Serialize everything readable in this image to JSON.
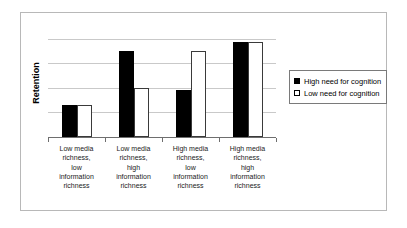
{
  "chart_data": {
    "type": "bar",
    "title": "",
    "xlabel": "",
    "ylabel": "Retention",
    "ylim": [
      0,
      110
    ],
    "grid": true,
    "gridlines": [
      25,
      50,
      75,
      100
    ],
    "legend_position": "right",
    "categories": [
      "Low media richness, low information richness",
      "Low media richness, high information richness",
      "High media richness, low information richness",
      "High media richness, high information richness"
    ],
    "category_lines": [
      [
        "Low media",
        "richness,",
        "low",
        "information",
        "richness"
      ],
      [
        "Low media",
        "richness,",
        "high",
        "information",
        "richness"
      ],
      [
        "High media",
        "richness,",
        "low",
        "information",
        "richness"
      ],
      [
        "High media",
        "richness,",
        "high",
        "information",
        "richness"
      ]
    ],
    "series": [
      {
        "name": "High need for cognition",
        "marker": "filled-square",
        "color": "#000000",
        "values": [
          33,
          88,
          48,
          97
        ]
      },
      {
        "name": "Low need for cognition",
        "marker": "open-square",
        "color": "#ffffff",
        "values": [
          33,
          50,
          88,
          97
        ]
      }
    ]
  },
  "legend": {
    "items": [
      {
        "label": "High need for cognition"
      },
      {
        "label": "Low need for cognition"
      }
    ]
  },
  "colors": {
    "high_need": "#000000",
    "low_need": "#ffffff",
    "gridline": "#c9c9c9",
    "axis": "#6e6e6e",
    "frame": "#b8b8b8"
  }
}
